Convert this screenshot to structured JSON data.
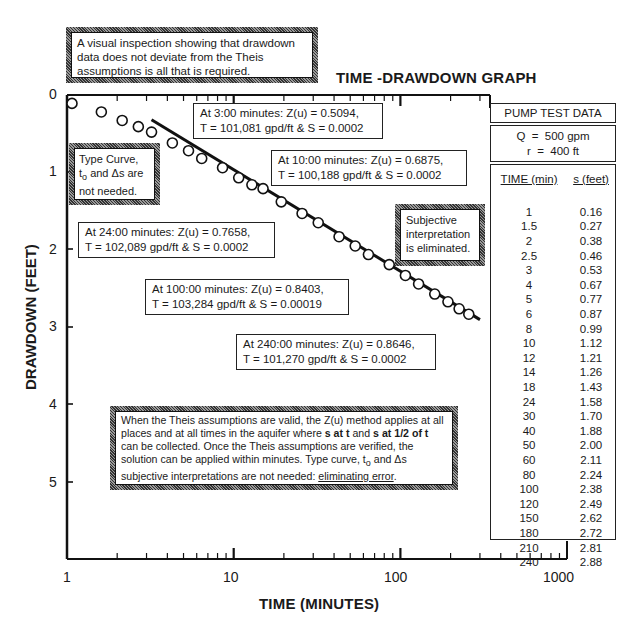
{
  "chart_data": {
    "type": "scatter",
    "title": "TIME -DRAWDOWN GRAPH",
    "xlabel": "TIME (MINUTES)",
    "ylabel": "DRAWDOWN (FEET)",
    "xscale": "log",
    "xlim": [
      1,
      1000
    ],
    "ylim": [
      0,
      6
    ],
    "y_inverted": true,
    "x_tick_labels": [
      "1",
      "10",
      "100",
      "1000"
    ],
    "y_tick_labels": [
      "0",
      "1",
      "2",
      "3",
      "4",
      "5"
    ],
    "grid": false,
    "series": [
      {
        "name": "Observed drawdown",
        "marker": "open-circle",
        "x": [
          1,
          1.5,
          2,
          2.5,
          3,
          4,
          5,
          6,
          8,
          10,
          12,
          14,
          18,
          24,
          30,
          40,
          50,
          60,
          80,
          100,
          120,
          150,
          180,
          210,
          240
        ],
        "y": [
          0.16,
          0.27,
          0.38,
          0.46,
          0.53,
          0.67,
          0.77,
          0.87,
          0.99,
          1.12,
          1.21,
          1.26,
          1.43,
          1.58,
          1.7,
          1.88,
          2.0,
          2.11,
          2.24,
          2.38,
          2.49,
          2.62,
          2.72,
          2.81,
          2.88
        ]
      },
      {
        "name": "Straight-line fit",
        "type": "line",
        "x": [
          3,
          280
        ],
        "y": [
          0.37,
          2.95
        ]
      }
    ]
  },
  "notes": {
    "top": "A visual inspection showing that drawdown data does not deviate from the Theis assumptions is all that is required.",
    "type_curve": {
      "line1": "Type Curve,",
      "line2_a": "t",
      "line2_sub": "o",
      "line2_b": " and Δs are",
      "line3": "not needed."
    },
    "subjective": {
      "line1": "Subjective",
      "line2": "interpretation",
      "line3": "is eliminated."
    },
    "bottom": {
      "p1": "When the Theis assumptions are valid, the Z(u) method applies at all places and at all times in the aquifer where ",
      "b1": "s at t",
      "p2": " and ",
      "b2": "s at 1/2 of t",
      "p3": " can be collected.  Once the Theis assumptions are verified, the solution can be applied within minutes. Type curve, t",
      "sub": "o",
      "p4": " and Δs subjective interpretations are not needed: ",
      "u": "eliminating error",
      "p5": "."
    }
  },
  "annotations": [
    {
      "line1": "At 3:00 minutes: Z(u) = 0.5094,",
      "line2": "T = 101,081 gpd/ft & S = 0.0002"
    },
    {
      "line1": "At 10:00 minutes: Z(u) = 0.6875,",
      "line2": "T = 100,188 gpd/ft & S = 0.0002"
    },
    {
      "line1": "At 24:00 minutes: Z(u) = 0.7658,",
      "line2": "T = 102,089 gpd/ft & S = 0.0002"
    },
    {
      "line1": "At 100:00 minutes: Z(u) = 0.8403,",
      "line2": "T = 103,284 gpd/ft & S = 0.00019"
    },
    {
      "line1": "At 240:00 minutes: Z(u) = 0.8646,",
      "line2": "T = 101,270 gpd/ft & S = 0.0002"
    }
  ],
  "pump_test": {
    "title": "PUMP TEST DATA",
    "q": "Q  =  500 gpm",
    "r": "r  =  400 ft",
    "col_time": "TIME (min)",
    "col_s": "s (feet)",
    "rows": [
      [
        "1",
        "0.16"
      ],
      [
        "1.5",
        "0.27"
      ],
      [
        "2",
        "0.38"
      ],
      [
        "2.5",
        "0.46"
      ],
      [
        "3",
        "0.53"
      ],
      [
        "4",
        "0.67"
      ],
      [
        "5",
        "0.77"
      ],
      [
        "6",
        "0.87"
      ],
      [
        "8",
        "0.99"
      ],
      [
        "10",
        "1.12"
      ],
      [
        "12",
        "1.21"
      ],
      [
        "14",
        "1.26"
      ],
      [
        "18",
        "1.43"
      ],
      [
        "24",
        "1.58"
      ],
      [
        "30",
        "1.70"
      ],
      [
        "40",
        "1.88"
      ],
      [
        "50",
        "2.00"
      ],
      [
        "60",
        "2.11"
      ],
      [
        "80",
        "2.24"
      ],
      [
        "100",
        "2.38"
      ],
      [
        "120",
        "2.49"
      ],
      [
        "150",
        "2.62"
      ],
      [
        "180",
        "2.72"
      ],
      [
        "210",
        "2.81"
      ],
      [
        "240",
        "2.88"
      ]
    ]
  }
}
